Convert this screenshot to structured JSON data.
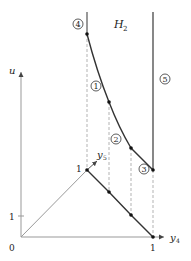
{
  "diagram": {
    "region_label": "H",
    "region_subscript": "2",
    "axes": {
      "vertical": {
        "label": "u",
        "tick_label": "1",
        "origin_label": "0"
      },
      "horizontal": {
        "label": "y",
        "label_subscript": "4",
        "tick_label": "1"
      },
      "diagonal": {
        "label": "y",
        "label_subscript": "5",
        "tick_label": "1"
      }
    },
    "circled_labels": [
      {
        "id": "4",
        "text": "4"
      },
      {
        "id": "1",
        "text": "1"
      },
      {
        "id": "2",
        "text": "2"
      },
      {
        "id": "3",
        "text": "3"
      },
      {
        "id": "5",
        "text": "5"
      }
    ],
    "colors": {
      "line": "#333333",
      "axis": "#888888",
      "dashed": "#aaaaaa"
    }
  }
}
